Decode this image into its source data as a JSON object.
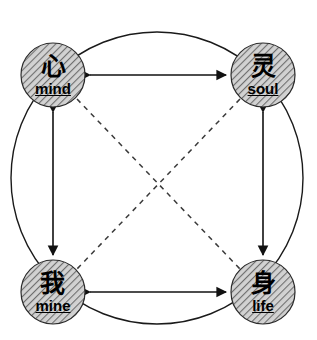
{
  "diagram": {
    "canvas": {
      "width": 317,
      "height": 340,
      "background": "#ffffff"
    },
    "outer_circle": {
      "name": "enclosing-circle",
      "cx": 157,
      "cy": 178,
      "r": 146,
      "stroke": "#1a1a1a",
      "stroke_width": 1.4,
      "style": "solid"
    },
    "node_style": {
      "radius": 32,
      "fill": "#c9c9c9",
      "hatch_color": "#6e6e6e",
      "hatch_direction": "forward-slash",
      "stroke": "#2b2b2b",
      "stroke_width": 1.2
    },
    "nodes": [
      {
        "id": "mind",
        "name": "node-mind",
        "glyph": "心",
        "roman": "mind",
        "cx": 53,
        "cy": 75,
        "position": "top-left"
      },
      {
        "id": "soul",
        "name": "node-soul",
        "glyph": "灵",
        "roman": "soul",
        "cx": 263,
        "cy": 75,
        "position": "top-right"
      },
      {
        "id": "mine",
        "name": "node-mine",
        "glyph": "我",
        "roman": "mine",
        "cx": 53,
        "cy": 292,
        "position": "bottom-left"
      },
      {
        "id": "life",
        "name": "node-life",
        "glyph": "身",
        "roman": "life",
        "cx": 263,
        "cy": 292,
        "position": "bottom-right"
      }
    ],
    "edges": [
      {
        "id": "mind-soul",
        "name": "edge-mind-soul",
        "from": "mind",
        "to": "soul",
        "style": "solid",
        "arrows": "both",
        "x1": 88,
        "y1": 75,
        "x2": 228,
        "y2": 75,
        "stroke": "#111111",
        "stroke_width": 1.6
      },
      {
        "id": "mine-life",
        "name": "edge-mine-life",
        "from": "mine",
        "to": "life",
        "style": "solid",
        "arrows": "both",
        "x1": 88,
        "y1": 292,
        "x2": 228,
        "y2": 292,
        "stroke": "#111111",
        "stroke_width": 1.6
      },
      {
        "id": "mind-mine",
        "name": "edge-mind-mine",
        "from": "mind",
        "to": "mine",
        "style": "solid",
        "arrows": "both",
        "x1": 53,
        "y1": 110,
        "x2": 53,
        "y2": 257,
        "stroke": "#111111",
        "stroke_width": 1.6
      },
      {
        "id": "soul-life",
        "name": "edge-soul-life",
        "from": "soul",
        "to": "life",
        "style": "solid",
        "arrows": "both",
        "x1": 263,
        "y1": 110,
        "x2": 263,
        "y2": 257,
        "stroke": "#111111",
        "stroke_width": 1.6
      },
      {
        "id": "mind-life",
        "name": "edge-mind-life-diagonal",
        "from": "mind",
        "to": "life",
        "style": "dashed",
        "arrows": "none",
        "x1": 77,
        "y1": 99,
        "x2": 240,
        "y2": 269,
        "stroke": "#3a3a3a",
        "stroke_width": 1.5,
        "dash": "5 5"
      },
      {
        "id": "soul-mine",
        "name": "edge-soul-mine-diagonal",
        "from": "soul",
        "to": "mine",
        "style": "dashed",
        "arrows": "none",
        "x1": 240,
        "y1": 99,
        "x2": 77,
        "y2": 269,
        "stroke": "#3a3a3a",
        "stroke_width": 1.5,
        "dash": "5 5"
      }
    ]
  }
}
